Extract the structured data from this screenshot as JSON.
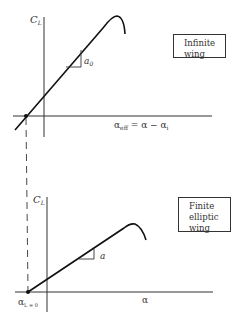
{
  "top_panel": {
    "y_label": "C",
    "y_label_sub": "L",
    "slope_label": "a",
    "slope_label_sub": "0",
    "x_label": "α",
    "x_label_sub": "eff",
    "x_label_rest": " = α − α",
    "x_label_rest_sub": "i",
    "box_lines": [
      "Infinite",
      "wing"
    ]
  },
  "bottom_panel": {
    "y_label": "C",
    "y_label_sub": "L",
    "slope_label": "a",
    "x_label": "α",
    "origin_label": "α",
    "origin_label_sub": "L = 0",
    "box_lines": [
      "Finite",
      "elliptic",
      "wing"
    ]
  },
  "colors": {
    "line": "#111111",
    "axis": "#333333",
    "text": "#333333",
    "background": "#ffffff"
  }
}
